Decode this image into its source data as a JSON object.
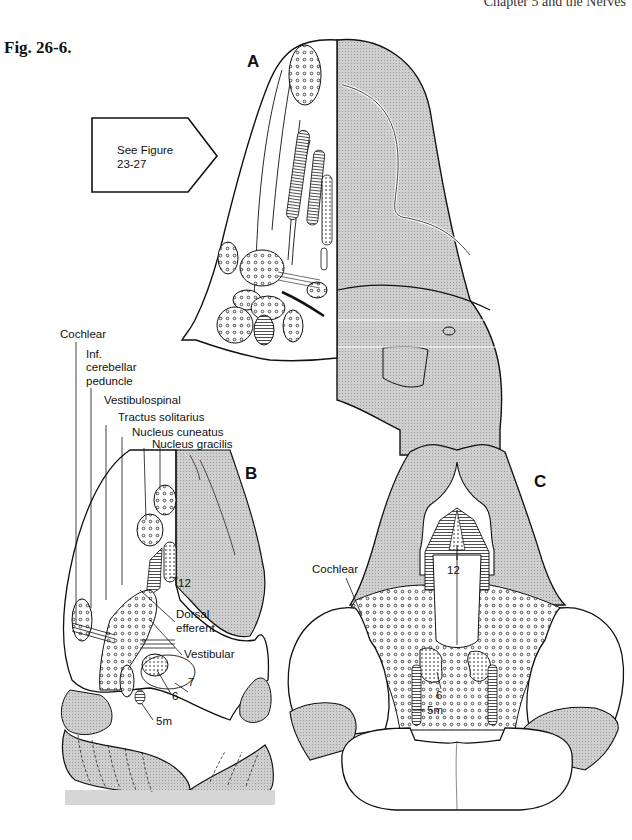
{
  "page": {
    "running_head": "Chapter 5 and the Nerves",
    "figure_label": "Fig. 26-6."
  },
  "panels": {
    "A": {
      "letter": "A",
      "callout": {
        "line1": "See Figure",
        "line2": "23-27"
      }
    },
    "B": {
      "letter": "B",
      "labels": {
        "cochlear": "Cochlear",
        "inf_cerebellar_1": "Inf.",
        "inf_cerebellar_2": "cerebellar",
        "inf_cerebellar_3": "peduncle",
        "vestibulospinal": "Vestibulospinal",
        "tractus_solitarius": "Tractus solitarius",
        "nucleus_cuneatus": "Nucleus cuneatus",
        "nucleus_gracilis": "Nucleus gracilis",
        "n12": "12",
        "dorsal_efferent_1": "Dorsal",
        "dorsal_efferent_2": "efferent",
        "vestibular": "Vestibular",
        "n7": "7",
        "n6": "6",
        "n5m": "5m"
      }
    },
    "C": {
      "letter": "C",
      "labels": {
        "cochlear": "Cochlear",
        "n12": "12",
        "n6": "6",
        "n5m": "5m"
      }
    }
  },
  "colors": {
    "ink": "#111111",
    "shade": "#c8c8c8",
    "shade_dark": "#b4b4b4",
    "paper": "#ffffff"
  }
}
